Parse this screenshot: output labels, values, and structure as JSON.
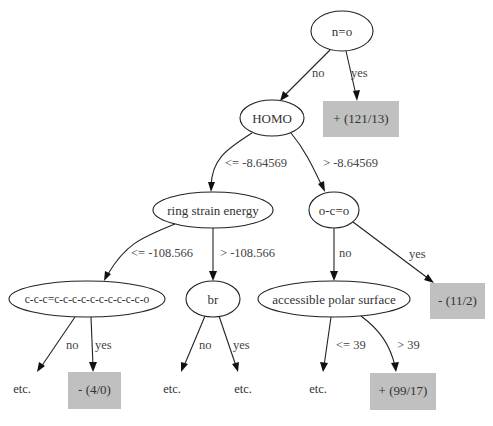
{
  "diagram": {
    "type": "decision-tree",
    "colors": {
      "leaf_fill": "#c0c0c0",
      "stroke": "#222222",
      "text": "#333333",
      "background": "#ffffff"
    },
    "nodes": {
      "root": {
        "label": "n=o"
      },
      "homo": {
        "label": "HOMO"
      },
      "leaf_121_13": {
        "label": "+ (121/13)"
      },
      "ring_strain": {
        "label": "ring strain energy"
      },
      "oco": {
        "label": "o-c=o"
      },
      "chain": {
        "label": "c-c-c=c-c-c-c-c-c-c-c-c-c-o"
      },
      "br": {
        "label": "br"
      },
      "polar_surface": {
        "label": "accessible polar surface"
      },
      "leaf_11_2": {
        "label": "- (11/2)"
      },
      "etc_1": {
        "label": "etc."
      },
      "leaf_4_0": {
        "label": "- (4/0)"
      },
      "etc_2": {
        "label": "etc."
      },
      "etc_3": {
        "label": "etc."
      },
      "etc_4": {
        "label": "etc."
      },
      "leaf_99_17": {
        "label": "+ (99/17)"
      }
    },
    "edges": {
      "root_no": {
        "label": "no"
      },
      "root_yes": {
        "label": "yes"
      },
      "homo_le": {
        "label": "<= -8.64569"
      },
      "homo_gt": {
        "label": "> -8.64569"
      },
      "ring_le": {
        "label": "<= -108.566"
      },
      "ring_gt": {
        "label": "> -108.566"
      },
      "oco_no": {
        "label": "no"
      },
      "oco_yes": {
        "label": "yes"
      },
      "chain_no": {
        "label": "no"
      },
      "chain_yes": {
        "label": "yes"
      },
      "br_no": {
        "label": "no"
      },
      "br_yes": {
        "label": "yes"
      },
      "polar_le": {
        "label": "<= 39"
      },
      "polar_gt": {
        "label": "> 39"
      }
    }
  }
}
